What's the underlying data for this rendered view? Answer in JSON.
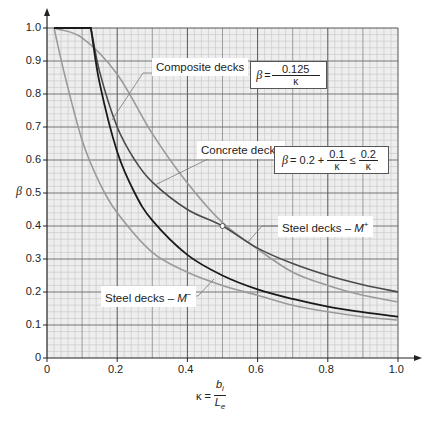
{
  "chart_data": {
    "type": "line",
    "title": "",
    "xlabel": "κ = b_i / L_e",
    "ylabel": "β",
    "xlim": [
      0,
      1.0
    ],
    "ylim": [
      0,
      1.0
    ],
    "grid": true,
    "x_ticks": [
      "0",
      "0.2",
      "0.4",
      "0.6",
      "0.8",
      "1.0"
    ],
    "y_ticks": [
      "0",
      "0.1",
      "0.2",
      "0.3",
      "0.4",
      "0.5",
      "0.6",
      "0.7",
      "0.8",
      "0.9",
      "1.0"
    ],
    "series": [
      {
        "name": "Composite decks",
        "formula": "β = 0.125/κ",
        "color": "#1a1a1a",
        "x": [
          0.02,
          0.125,
          0.15,
          0.2,
          0.25,
          0.3,
          0.4,
          0.5,
          0.6,
          0.7,
          0.8,
          0.9,
          1.0
        ],
        "y": [
          1.0,
          1.0,
          0.833,
          0.625,
          0.5,
          0.417,
          0.3125,
          0.25,
          0.208,
          0.179,
          0.156,
          0.139,
          0.125
        ]
      },
      {
        "name": "Concrete decks",
        "formula": "β = 0.2 + 0.1/κ ≤ 0.2/κ",
        "color": "#4a4a4a",
        "x": [
          0.02,
          0.125,
          0.15,
          0.2,
          0.25,
          0.3,
          0.4,
          0.5,
          0.6,
          0.7,
          0.8,
          0.9,
          1.0
        ],
        "y": [
          1.0,
          1.0,
          0.867,
          0.7,
          0.6,
          0.533,
          0.45,
          0.4,
          0.333,
          0.286,
          0.25,
          0.222,
          0.2
        ]
      },
      {
        "name": "Steel decks – M+",
        "color": "#9a9a9a",
        "x": [
          0.02,
          0.1,
          0.2,
          0.3,
          0.4,
          0.5,
          0.6,
          0.7,
          0.8,
          0.9,
          1.0
        ],
        "y": [
          1.0,
          0.97,
          0.86,
          0.68,
          0.53,
          0.41,
          0.33,
          0.26,
          0.22,
          0.19,
          0.17
        ]
      },
      {
        "name": "Steel decks – M−",
        "color": "#9a9a9a",
        "x": [
          0.02,
          0.05,
          0.1,
          0.15,
          0.2,
          0.3,
          0.4,
          0.5,
          0.6,
          0.7,
          0.8,
          0.9,
          1.0
        ],
        "y": [
          1.0,
          0.86,
          0.66,
          0.53,
          0.44,
          0.32,
          0.26,
          0.22,
          0.19,
          0.16,
          0.14,
          0.125,
          0.115
        ]
      }
    ],
    "annotations": [
      {
        "text": "Composite decks",
        "formula": "β = 0.125/κ"
      },
      {
        "text": "Concrete decks",
        "formula": "β = 0.2 + 0.1/κ ≤ 0.2/κ"
      },
      {
        "text": "Steel decks – M+"
      },
      {
        "text": "Steel decks – M−"
      },
      {
        "marker": "circle",
        "x": 0.5,
        "y": 0.4
      }
    ]
  },
  "labels": {
    "composite": "Composite decks",
    "concrete": "Concrete decks",
    "steel_plus_prefix": "Steel decks – ",
    "steel_plus_m": "M",
    "steel_plus_sup": "+",
    "steel_minus_prefix": "Steel decks – ",
    "steel_minus_m": "M",
    "steel_minus_sup": "−"
  },
  "formulas": {
    "composite": {
      "beta": "β",
      "eq": "=",
      "num": "0.125",
      "den": "κ"
    },
    "concrete": {
      "beta": "β",
      "eq": "= 0.2 +",
      "num1": "0.1",
      "den1": "κ",
      "le": "≤",
      "num2": "0.2",
      "den2": "κ"
    }
  },
  "axes": {
    "ylabel": "β",
    "xlabel_kappa": "κ =",
    "xlabel_num": "b",
    "xlabel_num_sub": "i",
    "xlabel_den": "L",
    "xlabel_den_sub": "e"
  }
}
